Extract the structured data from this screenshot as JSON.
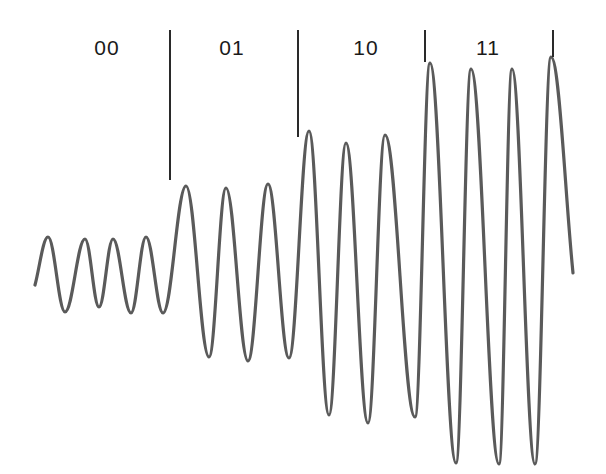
{
  "diagram": {
    "type": "waveform",
    "stroke_color": "#5a5a5a",
    "symbols": [
      {
        "label": "00",
        "label_x": 107,
        "amplitude_level": 1
      },
      {
        "label": "01",
        "label_x": 232,
        "amplitude_level": 2
      },
      {
        "label": "10",
        "label_x": 366,
        "amplitude_level": 3
      },
      {
        "label": "11",
        "label_x": 488,
        "amplitude_level": 4
      }
    ],
    "dividers": [
      {
        "x": 169,
        "top": 30,
        "bottom": 180
      },
      {
        "x": 297,
        "top": 30,
        "bottom": 137
      },
      {
        "x": 424,
        "top": 30,
        "bottom": 62
      },
      {
        "x": 552,
        "top": 30,
        "bottom": 57
      }
    ]
  },
  "chart_data": {
    "type": "line",
    "title": "",
    "xlabel": "",
    "ylabel": "",
    "categories": [
      "00",
      "01",
      "10",
      "11"
    ],
    "series": [
      {
        "name": "signal extrema (pixel coords)",
        "points": [
          [
            35,
            285
          ],
          [
            48,
            237
          ],
          [
            65,
            312
          ],
          [
            85,
            239
          ],
          [
            99,
            307
          ],
          [
            113,
            239
          ],
          [
            131,
            313
          ],
          [
            146,
            237
          ],
          [
            163,
            313
          ],
          [
            186,
            186
          ],
          [
            209,
            357
          ],
          [
            226,
            188
          ],
          [
            248,
            361
          ],
          [
            268,
            184
          ],
          [
            289,
            358
          ],
          [
            309,
            131
          ],
          [
            329,
            415
          ],
          [
            346,
            143
          ],
          [
            368,
            423
          ],
          [
            385,
            135
          ],
          [
            415,
            417
          ],
          [
            430,
            63
          ],
          [
            456,
            463
          ],
          [
            471,
            69
          ],
          [
            499,
            464
          ],
          [
            512,
            69
          ],
          [
            535,
            464
          ],
          [
            551,
            57
          ],
          [
            573,
            273
          ]
        ]
      }
    ]
  }
}
